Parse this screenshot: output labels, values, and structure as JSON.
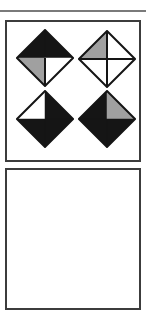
{
  "colors": {
    "black": "#151515",
    "gray": "#a0a0a0",
    "white": "#ffffff",
    "stroke": "#151515",
    "frame": "#3c3c3c",
    "rule": "#7a7a7a"
  },
  "panels": [
    {
      "id": "symbols-panel",
      "diamonds": [
        {
          "position": "top-left",
          "quadrants": {
            "top-left": "black",
            "top-right": "black",
            "bottom-left": "gray",
            "bottom-right": "white"
          }
        },
        {
          "position": "top-right",
          "quadrants": {
            "top-left": "gray",
            "top-right": "white",
            "bottom-left": "white",
            "bottom-right": "white"
          }
        },
        {
          "position": "bottom-left",
          "quadrants": {
            "top-left": "white",
            "top-right": "black",
            "bottom-left": "black",
            "bottom-right": "black"
          }
        },
        {
          "position": "bottom-right",
          "quadrants": {
            "top-left": "black",
            "top-right": "gray",
            "bottom-left": "black",
            "bottom-right": "black"
          }
        }
      ]
    },
    {
      "id": "empty-panel",
      "diamonds": []
    }
  ]
}
